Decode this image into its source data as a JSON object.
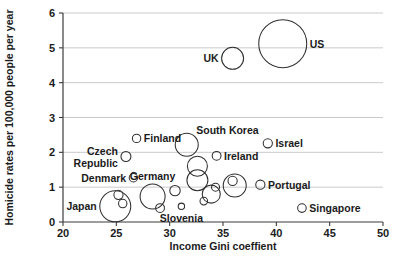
{
  "chart_data": {
    "type": "scatter",
    "title": "",
    "subtitle": "",
    "xlabel": "Income Gini coeffient",
    "ylabel": "Homicide rates per 100,000 people per year",
    "xlim": [
      20,
      50
    ],
    "ylim": [
      0,
      6
    ],
    "xticks": [
      20,
      25,
      30,
      35,
      40,
      45,
      50
    ],
    "yticks": [
      0,
      1,
      2,
      3,
      4,
      5,
      6
    ],
    "xtick_labels": [
      "20",
      "25",
      "30",
      "35",
      "40",
      "45",
      "50"
    ],
    "ytick_labels": [
      "0",
      "1",
      "2",
      "3",
      "4",
      "5",
      "6"
    ],
    "grid": "horizontal",
    "legend": "none",
    "marker_style": "open-circle-variable-size",
    "marker_note": "Bubble area encodes an unlabeled third variable (population); radii read in plot pixels.",
    "points": [
      {
        "name": "US",
        "x": 40.6,
        "y": 5.12,
        "r": 24.0,
        "labeled": true,
        "label": "US",
        "label_side": "right"
      },
      {
        "name": "UK",
        "x": 35.9,
        "y": 4.7,
        "r": 11.0,
        "labeled": true,
        "label": "UK",
        "label_side": "left"
      },
      {
        "name": "South Korea",
        "x": 31.6,
        "y": 2.22,
        "r": 11.5,
        "labeled": true,
        "label": "South Korea",
        "label_side": "above-right"
      },
      {
        "name": "Finland",
        "x": 26.9,
        "y": 2.4,
        "r": 4.2,
        "labeled": true,
        "label": "Finland",
        "label_side": "right"
      },
      {
        "name": "Israel",
        "x": 39.2,
        "y": 2.26,
        "r": 4.6,
        "labeled": true,
        "label": "Israel",
        "label_side": "right"
      },
      {
        "name": "Czech Republic",
        "x": 25.9,
        "y": 1.88,
        "r": 5.0,
        "labeled": true,
        "label": "Czech Republic",
        "label_side": "left"
      },
      {
        "name": "Ireland",
        "x": 34.4,
        "y": 1.9,
        "r": 4.4,
        "labeled": true,
        "label": "Ireland",
        "label_side": "right"
      },
      {
        "name": "Denmark",
        "x": 26.6,
        "y": 1.27,
        "r": 4.2,
        "labeled": true,
        "label": "Denmark",
        "label_side": "left"
      },
      {
        "name": "Portugal",
        "x": 38.5,
        "y": 1.07,
        "r": 4.6,
        "labeled": true,
        "label": "Portugal",
        "label_side": "right"
      },
      {
        "name": "Germany",
        "x": 28.4,
        "y": 0.73,
        "r": 12.5,
        "labeled": true,
        "label": "Germany",
        "label_side": "above"
      },
      {
        "name": "Japan",
        "x": 24.9,
        "y": 0.45,
        "r": 15.5,
        "labeled": true,
        "label": "Japan",
        "label_side": "left"
      },
      {
        "name": "Slovenia",
        "x": 31.1,
        "y": 0.45,
        "r": 3.2,
        "labeled": true,
        "label": "Slovenia",
        "label_side": "below"
      },
      {
        "name": "Singapore",
        "x": 42.4,
        "y": 0.4,
        "r": 4.3,
        "labeled": true,
        "label": "Singapore",
        "label_side": "right"
      },
      {
        "name": "unlabeled-1",
        "x": 32.6,
        "y": 1.6,
        "r": 10.0,
        "labeled": false,
        "label": "",
        "label_side": ""
      },
      {
        "name": "unlabeled-2",
        "x": 32.6,
        "y": 1.2,
        "r": 10.5,
        "labeled": false,
        "label": "",
        "label_side": ""
      },
      {
        "name": "unlabeled-3",
        "x": 36.1,
        "y": 1.05,
        "r": 11.5,
        "labeled": false,
        "label": "",
        "label_side": ""
      },
      {
        "name": "unlabeled-4",
        "x": 33.9,
        "y": 0.8,
        "r": 9.0,
        "labeled": false,
        "label": "",
        "label_side": ""
      },
      {
        "name": "unlabeled-5",
        "x": 34.3,
        "y": 1.0,
        "r": 4.0,
        "labeled": false,
        "label": "",
        "label_side": ""
      },
      {
        "name": "unlabeled-6",
        "x": 35.9,
        "y": 1.18,
        "r": 4.6,
        "labeled": false,
        "label": "",
        "label_side": ""
      },
      {
        "name": "unlabeled-7",
        "x": 33.2,
        "y": 0.6,
        "r": 3.8,
        "labeled": false,
        "label": "",
        "label_side": ""
      },
      {
        "name": "unlabeled-8",
        "x": 30.5,
        "y": 0.9,
        "r": 5.2,
        "labeled": false,
        "label": "",
        "label_side": ""
      },
      {
        "name": "unlabeled-9",
        "x": 25.2,
        "y": 0.78,
        "r": 4.6,
        "labeled": false,
        "label": "",
        "label_side": ""
      },
      {
        "name": "unlabeled-10",
        "x": 25.6,
        "y": 0.53,
        "r": 4.2,
        "labeled": false,
        "label": "",
        "label_side": ""
      },
      {
        "name": "unlabeled-11",
        "x": 29.1,
        "y": 0.4,
        "r": 4.4,
        "labeled": false,
        "label": "",
        "label_side": ""
      }
    ]
  }
}
